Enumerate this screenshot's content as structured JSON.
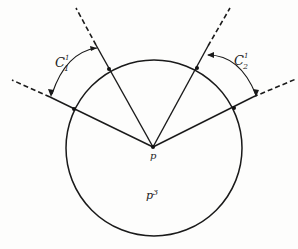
{
  "diagram": {
    "labels": {
      "angle1": "C",
      "angle1_sub": "1",
      "angle1_sup": "1",
      "angle2": "C",
      "angle2_sub": "2",
      "angle2_sup": "1",
      "point": "p",
      "region": "p",
      "region_sup": "3"
    },
    "colors": {
      "stroke": "#1a1a1a",
      "background": "#fdfdfc"
    }
  }
}
